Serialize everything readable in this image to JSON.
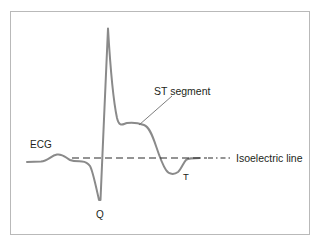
{
  "figure": {
    "type": "ecg-waveform-diagram",
    "background_color": "#ffffff",
    "frame": {
      "name": "diagram-border",
      "x": 10.5,
      "y": 11.5,
      "width": 299,
      "height": 223,
      "stroke_color": "#b9b9b9"
    },
    "trace": {
      "name": "ecg-waveform",
      "color": "#8a8a8a",
      "stroke_width": 2,
      "baseline_y": 162,
      "path": "M 27,162 L 41,161.5 C 48,161 51,155.5 57,154.5 C 63,153.5 66,158 70,160 C 74,161.6 78,161.2 82,161.4 C 86,161.6 88,163 90,166 C 92.5,170 94.5,180 99,200 L 100.5,200 C 103,150 105.5,75 108,28.5 C 110,62 114,104 117,118 C 119.5,128 123,124 127,123 C 133,122 139,123.2 144,125 C 149,127 152,134 156,146 C 159,155 162,164 166,170 C 169,174.5 174,175 178,172 C 181,169.6 183.5,162.5 186,160 C 188.5,158 192,158 200,158"
    },
    "isoelectric": {
      "name": "isoelectric-line",
      "color": "#2b2b2b",
      "y": 158,
      "dash_x_start": 72,
      "dash_x_end": 207,
      "dash_pattern": "7,4",
      "dashdot_x_start": 208,
      "dashdot_x_end": 232,
      "dashdot_pattern": "5,3,1.5,3"
    },
    "leader": {
      "name": "st-segment-leader-line",
      "color": "#6f6f6f",
      "x1": 139,
      "y1": 125,
      "x2": 172,
      "y2": 96
    },
    "labels": {
      "ecg": "ECG",
      "st_segment": "ST segment",
      "isoelectric_line": "Isoelectric line",
      "q": "Q",
      "t": "T"
    },
    "label_positions": {
      "ecg": {
        "x": 30,
        "y": 148
      },
      "st_segment": {
        "x": 154,
        "y": 95
      },
      "isoelectric_line": {
        "x": 236,
        "y": 162
      },
      "q": {
        "x": 96,
        "y": 218
      },
      "t": {
        "x": 183,
        "y": 180
      }
    },
    "text_color": "#231f20"
  }
}
